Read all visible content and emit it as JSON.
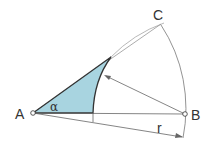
{
  "labels": {
    "A": "A",
    "B": "B",
    "C": "C",
    "r": "r",
    "alpha": "α"
  },
  "colors": {
    "fill": "#a8d4e0",
    "stroke": "#333333",
    "thin": "#777777"
  }
}
